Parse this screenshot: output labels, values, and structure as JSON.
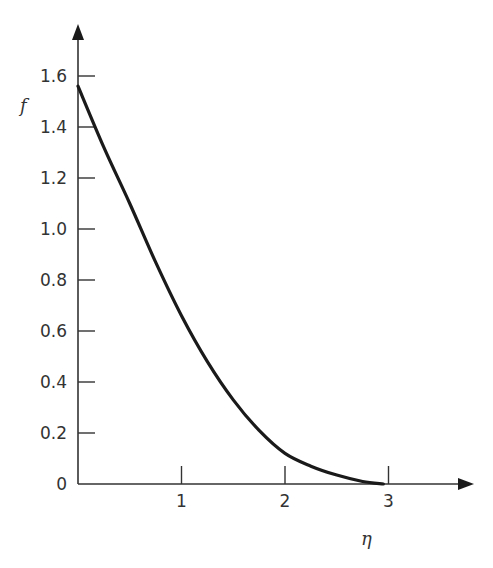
{
  "chart_data": {
    "type": "line",
    "title": "",
    "xlabel": "η",
    "ylabel": "f",
    "xlim": [
      0,
      3.5
    ],
    "ylim": [
      0,
      1.7
    ],
    "grid": false,
    "legend": null,
    "x_ticks": [
      1,
      2,
      3
    ],
    "x_tick_labels": [
      "1",
      "2",
      "3"
    ],
    "y_ticks": [
      0,
      0.2,
      0.4,
      0.6,
      0.8,
      1.0,
      1.2,
      1.4,
      1.6
    ],
    "y_tick_labels": [
      "0",
      "0.2",
      "0.4",
      "0.6",
      "0.8",
      "1.0",
      "1.2",
      "1.4",
      "1.6"
    ],
    "series": [
      {
        "name": "f(η)",
        "color": "#1a1a1a",
        "x": [
          0,
          0.25,
          0.5,
          0.75,
          1.0,
          1.25,
          1.5,
          1.75,
          2.0,
          2.25,
          2.5,
          2.75,
          2.95
        ],
        "y": [
          1.56,
          1.32,
          1.1,
          0.87,
          0.66,
          0.48,
          0.33,
          0.21,
          0.12,
          0.07,
          0.035,
          0.01,
          0.0
        ]
      }
    ]
  },
  "labels": {
    "y_axis": "f",
    "x_axis": "η"
  }
}
